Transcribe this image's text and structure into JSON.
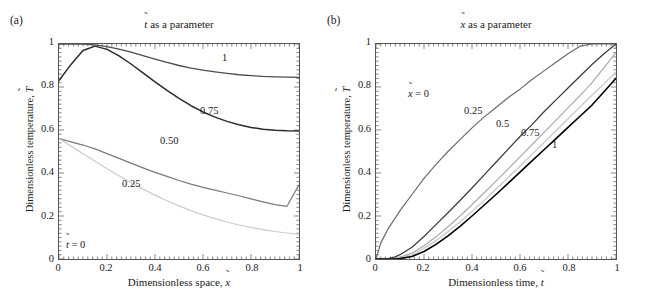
{
  "figure": {
    "panels": [
      {
        "letter": "(a)",
        "title_prefix": "",
        "title_var": "t",
        "title_suffix": " as a parameter",
        "title_text": "t̃ as a parameter",
        "xlabel_text": "Dimensionless space, x̃",
        "xlabel_prefix": "Dimensionless space, ",
        "xlabel_var": "x",
        "ylabel_text": "Dimensionless temperature, T̃",
        "ylabel_prefix": "Dimensionless temperature, ",
        "ylabel_var": "T",
        "xticks": [
          "0",
          "0.2",
          "0.4",
          "0.6",
          "0.8",
          "1"
        ],
        "yticks": [
          "0",
          "0.2",
          "0.4",
          "0.6",
          "0.8",
          "1"
        ],
        "curve_labels": [
          "1",
          "0.75",
          "0.50",
          "0.25"
        ],
        "zero_label_prefix": "",
        "zero_label_var": "t",
        "zero_label_suffix": " = 0",
        "zero_label_text": "t̃ = 0"
      },
      {
        "letter": "(b)",
        "title_var": "x",
        "title_suffix": " as a parameter",
        "title_text": "x̃ as a parameter",
        "xlabel_text": "Dimensionless time, t̃",
        "xlabel_prefix": "Dimensionless time, ",
        "xlabel_var": "t",
        "ylabel_text": "Dimensionless temperature, T̃",
        "ylabel_prefix": "Dimensionless temperature, ",
        "ylabel_var": "T",
        "xticks": [
          "0",
          "0.2",
          "0.4",
          "0.6",
          "0.8",
          "1"
        ],
        "yticks": [
          "0",
          "0.2",
          "0.4",
          "0.6",
          "0.8",
          "1"
        ],
        "first_label_prefix": "",
        "first_label_var": "x",
        "first_label_suffix": " = 0",
        "first_label_text": "x̃ = 0",
        "curve_labels": [
          "0.25",
          "0.5",
          "0.75",
          "1"
        ]
      }
    ]
  },
  "chart_data": [
    {
      "type": "line",
      "panel": "(a)",
      "title": "t̃ as a parameter",
      "xlabel": "Dimensionless space, x̃",
      "ylabel": "Dimensionless temperature, T̃",
      "xlim": [
        0,
        1
      ],
      "ylim": [
        0,
        1
      ],
      "xticks": [
        0,
        0.2,
        0.4,
        0.6,
        0.8,
        1
      ],
      "yticks": [
        0,
        0.2,
        0.4,
        0.6,
        0.8,
        1
      ],
      "grid": false,
      "legend": "inline-curve-labels",
      "x": [
        0,
        0.05,
        0.1,
        0.15,
        0.2,
        0.25,
        0.3,
        0.35,
        0.4,
        0.45,
        0.5,
        0.55,
        0.6,
        0.65,
        0.7,
        0.75,
        0.8,
        0.85,
        0.9,
        0.95,
        1
      ],
      "series": [
        {
          "name": "1",
          "label": "1",
          "color": "#4d4d4d",
          "width": 1.3,
          "values": [
            1.0,
            1.0,
            1.0,
            0.996,
            0.988,
            0.976,
            0.962,
            0.946,
            0.93,
            0.914,
            0.9,
            0.888,
            0.878,
            0.87,
            0.863,
            0.857,
            0.853,
            0.849,
            0.847,
            0.846,
            0.845
          ]
        },
        {
          "name": "0.75",
          "label": "0.75",
          "color": "#2b2b2b",
          "width": 1.5,
          "values": [
            0.83,
            0.905,
            0.97,
            0.99,
            0.975,
            0.945,
            0.907,
            0.866,
            0.824,
            0.784,
            0.747,
            0.713,
            0.684,
            0.66,
            0.64,
            0.624,
            0.612,
            0.604,
            0.599,
            0.596,
            0.595
          ]
        },
        {
          "name": "0.50",
          "label": "0.50",
          "color": "#7a7a7a",
          "width": 1.2,
          "values": [
            0.56,
            0.545,
            0.53,
            0.512,
            0.49,
            0.468,
            0.446,
            0.424,
            0.403,
            0.384,
            0.365,
            0.348,
            0.333,
            0.32,
            0.307,
            0.294,
            0.28,
            0.266,
            0.253,
            0.245,
            0.345
          ]
        },
        {
          "name": "0.25",
          "label": "0.25",
          "color": "#cccccc",
          "width": 1.2,
          "values": [
            0.56,
            0.525,
            0.49,
            0.455,
            0.42,
            0.387,
            0.355,
            0.325,
            0.297,
            0.271,
            0.247,
            0.225,
            0.205,
            0.188,
            0.172,
            0.158,
            0.147,
            0.137,
            0.128,
            0.121,
            0.115
          ]
        }
      ]
    },
    {
      "type": "line",
      "panel": "(b)",
      "title": "x̃ as a parameter",
      "xlabel": "Dimensionless time, t̃",
      "ylabel": "Dimensionless temperature, T̃",
      "xlim": [
        0,
        1
      ],
      "ylim": [
        0,
        1
      ],
      "xticks": [
        0,
        0.2,
        0.4,
        0.6,
        0.8,
        1
      ],
      "yticks": [
        0,
        0.2,
        0.4,
        0.6,
        0.8,
        1
      ],
      "grid": false,
      "legend": "inline-curve-labels",
      "x": [
        0,
        0.02,
        0.05,
        0.08,
        0.1,
        0.15,
        0.2,
        0.25,
        0.3,
        0.35,
        0.4,
        0.45,
        0.5,
        0.55,
        0.6,
        0.65,
        0.7,
        0.75,
        0.8,
        0.85,
        0.9,
        0.95,
        1
      ],
      "series": [
        {
          "name": "0",
          "label": "x̃ = 0",
          "color": "#6b6b6b",
          "width": 1.2,
          "values": [
            0.0,
            0.075,
            0.14,
            0.19,
            0.225,
            0.3,
            0.375,
            0.44,
            0.5,
            0.555,
            0.61,
            0.66,
            0.705,
            0.75,
            0.79,
            0.835,
            0.875,
            0.915,
            0.955,
            0.99,
            1.0,
            1.0,
            1.0
          ]
        },
        {
          "name": "0.25",
          "label": "0.25",
          "color": "#3d3d3d",
          "width": 1.3,
          "values": [
            0.0,
            0.0,
            0.002,
            0.01,
            0.02,
            0.055,
            0.105,
            0.16,
            0.215,
            0.272,
            0.33,
            0.39,
            0.45,
            0.51,
            0.57,
            0.625,
            0.685,
            0.74,
            0.795,
            0.85,
            0.905,
            0.955,
            1.0
          ]
        },
        {
          "name": "0.5",
          "label": "0.5",
          "color": "#d0d0d0",
          "width": 1.6,
          "values": [
            0.0,
            0.0,
            0.0,
            0.002,
            0.005,
            0.02,
            0.05,
            0.085,
            0.127,
            0.173,
            0.222,
            0.272,
            0.325,
            0.378,
            0.432,
            0.487,
            0.542,
            0.597,
            0.652,
            0.707,
            0.762,
            0.815,
            0.87
          ]
        },
        {
          "name": "0.75",
          "label": "0.75",
          "color": "#a8a8a8",
          "width": 1.2,
          "values": [
            0.0,
            0.0,
            0.0,
            0.003,
            0.008,
            0.028,
            0.062,
            0.103,
            0.15,
            0.2,
            0.253,
            0.307,
            0.362,
            0.418,
            0.475,
            0.532,
            0.589,
            0.646,
            0.703,
            0.76,
            0.82,
            0.89,
            0.96
          ]
        },
        {
          "name": "1",
          "label": "1",
          "color": "#000000",
          "width": 1.6,
          "values": [
            0.0,
            0.0,
            0.0,
            0.0,
            0.002,
            0.012,
            0.035,
            0.068,
            0.108,
            0.152,
            0.2,
            0.25,
            0.3,
            0.352,
            0.404,
            0.456,
            0.508,
            0.56,
            0.612,
            0.664,
            0.716,
            0.778,
            0.84
          ]
        }
      ]
    }
  ]
}
